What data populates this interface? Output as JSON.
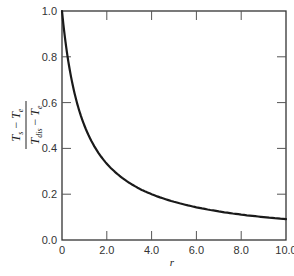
{
  "chart_data": {
    "type": "line",
    "title": "",
    "xlabel": "r",
    "ylabel": "(T_s - T_e) / (T_dis - T_e)",
    "ylabel_parts": {
      "numerator": {
        "T1": "T",
        "s1": "s",
        "minus": " − ",
        "T2": "T",
        "s2": "e"
      },
      "denominator": {
        "T1": "T",
        "s1": "dis",
        "minus": " − ",
        "T2": "T",
        "s2": "e"
      }
    },
    "xlim": [
      0,
      10
    ],
    "ylim": [
      0,
      1
    ],
    "x_ticks": [
      0,
      2,
      4,
      6,
      8,
      10
    ],
    "x_tick_labels": [
      "0",
      "2.0",
      "4.0",
      "6.0",
      "8.0",
      "10.0"
    ],
    "y_ticks": [
      0,
      0.2,
      0.4,
      0.6,
      0.8,
      1.0
    ],
    "y_tick_labels": [
      "0.0",
      "0.2",
      "0.4",
      "0.6",
      "0.8",
      "1.0"
    ],
    "grid": false,
    "legend": null,
    "series": [
      {
        "name": "curve",
        "x": [
          0,
          0.25,
          0.5,
          0.75,
          1.0,
          1.5,
          2.0,
          2.5,
          3.0,
          3.5,
          4.0,
          5.0,
          6.0,
          7.0,
          8.0,
          9.0,
          10.0
        ],
        "values": [
          1.0,
          0.8,
          0.667,
          0.571,
          0.5,
          0.4,
          0.333,
          0.286,
          0.25,
          0.222,
          0.2,
          0.167,
          0.143,
          0.125,
          0.111,
          0.1,
          0.091
        ]
      }
    ],
    "line_color": "#1a1a1a",
    "frame_color": "#333333"
  }
}
